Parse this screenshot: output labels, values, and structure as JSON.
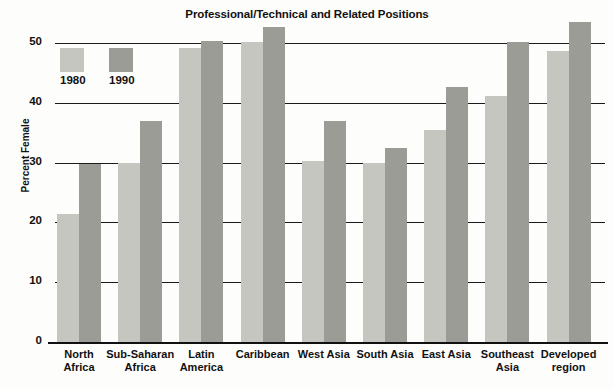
{
  "chart_data": {
    "type": "bar",
    "title": "Professional/Technical and Related Positions",
    "xlabel": "",
    "ylabel": "Percent Female",
    "ylim": [
      0,
      55
    ],
    "yticks": [
      0,
      10,
      20,
      30,
      40,
      50
    ],
    "ytick_labels": [
      "0",
      "10",
      "20",
      "30",
      "40",
      "50"
    ],
    "grid": "horizontal",
    "legend_position": "upper-left-inside",
    "categories": [
      "North Africa",
      "Sub-Saharan Africa",
      "Latin America",
      "Caribbean",
      "West Asia",
      "South Asia",
      "East Asia",
      "Southeast Asia",
      "Developed region"
    ],
    "category_lines": [
      [
        "North",
        "Africa"
      ],
      [
        "Sub-Saharan",
        "Africa"
      ],
      [
        "Latin",
        "America"
      ],
      [
        "Caribbean"
      ],
      [
        "West Asia"
      ],
      [
        "South Asia"
      ],
      [
        "East Asia"
      ],
      [
        "Southeast",
        "Asia"
      ],
      [
        "Developed",
        "region"
      ]
    ],
    "series": [
      {
        "name": "1980",
        "color": "#c6c6c1",
        "values": [
          21.4,
          30.0,
          49.2,
          50.2,
          30.2,
          29.9,
          35.5,
          41.2,
          48.7
        ]
      },
      {
        "name": "1990",
        "color": "#9c9c97",
        "values": [
          29.7,
          36.9,
          50.4,
          52.7,
          36.9,
          32.4,
          42.6,
          50.2,
          53.5
        ]
      }
    ]
  },
  "legend": {
    "entries": [
      {
        "label": "1980",
        "color": "#c6c6c1"
      },
      {
        "label": "1990",
        "color": "#9c9c97"
      }
    ]
  },
  "colors": {
    "series_1980": "#c6c6c1",
    "series_1990": "#9c9c97",
    "axis": "#111111",
    "background": "#fdfdfb"
  }
}
